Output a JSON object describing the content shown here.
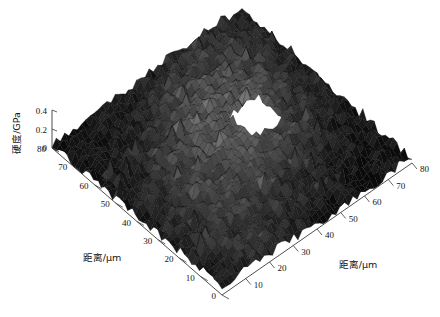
{
  "chart_data": {
    "type": "surface",
    "title": "",
    "subtitle": "",
    "projection": "3d-mesh-surface",
    "zlabel": "硬度/GPa",
    "xlabel": "距离/µm",
    "ylabel": "距离/µm",
    "zlim": [
      0,
      0.4
    ],
    "xlim": [
      0,
      80
    ],
    "ylim": [
      0,
      80
    ],
    "z_ticks": [
      "0",
      "0.2",
      "0.4"
    ],
    "z_tick_values": [
      0,
      0.2,
      0.4
    ],
    "x_ticks": [
      "0",
      "10",
      "20",
      "30",
      "40",
      "50",
      "60",
      "70",
      "80"
    ],
    "x_tick_values": [
      0,
      10,
      20,
      30,
      40,
      50,
      60,
      70,
      80
    ],
    "y_ticks": [
      "0",
      "10",
      "20",
      "30",
      "40",
      "50",
      "60",
      "70",
      "80"
    ],
    "y_tick_values": [
      0,
      10,
      20,
      30,
      40,
      50,
      60,
      70,
      80
    ],
    "left_axis_ticks": [
      "80",
      "70",
      "60",
      "50",
      "40",
      "30",
      "20",
      "10",
      "0"
    ],
    "right_axis_ticks": [
      "10",
      "20",
      "30",
      "40",
      "50",
      "60",
      "70",
      "80"
    ],
    "grid": false,
    "legend": false,
    "colormap": "gray",
    "surface_face_color_min": "#0a0a0a",
    "surface_face_color_max": "#8c8c8c",
    "mesh_edge_color": "#0d0d0d",
    "background": "#ffffff",
    "void_region": {
      "present": true,
      "description": "white gap / missing data patch right of center",
      "approx_x_range": [
        44,
        56
      ],
      "approx_y_range": [
        36,
        46
      ]
    }
  },
  "axes": {
    "z": {
      "label": "硬度/GPa",
      "ticks": [
        "0.4",
        "0.2",
        "0"
      ]
    },
    "left": {
      "label": "距离/µm",
      "ticks": [
        "80",
        "70",
        "60",
        "50",
        "40",
        "30",
        "20",
        "10",
        "0"
      ]
    },
    "right": {
      "label": "距离/µm",
      "ticks": [
        "0",
        "10",
        "20",
        "30",
        "40",
        "50",
        "60",
        "70",
        "80"
      ]
    }
  }
}
